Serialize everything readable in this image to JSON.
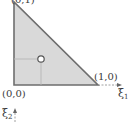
{
  "diagram": {
    "type": "reference-triangle",
    "vertices": [
      {
        "label": "(0,0)",
        "x": 0,
        "y": 0
      },
      {
        "label": "(1,0)",
        "x": 1,
        "y": 0
      },
      {
        "label": "(0,1)",
        "x": 0,
        "y": 1
      }
    ],
    "point": {
      "label": "centroid",
      "marker": "open-circle"
    },
    "axes": {
      "x": {
        "symbol": "ξ",
        "subscript": "1"
      },
      "y": {
        "symbol": "ξ",
        "subscript": "2"
      }
    },
    "colors": {
      "fill": "#d9d9d9",
      "edge": "#6e6e6e",
      "guide": "#b5b5b5",
      "text": "#3a3a3a"
    }
  }
}
